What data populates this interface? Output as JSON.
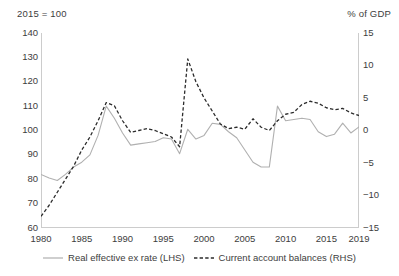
{
  "chart_data": {
    "type": "line",
    "title": "",
    "subtitle": "",
    "left_unit_label": "2015 = 100",
    "right_unit_label": "% of GDP",
    "xlabel": "",
    "ylabel": "",
    "grid": false,
    "legend_position": "bottom",
    "xlim": [
      1980,
      2019
    ],
    "x_ticks": [
      "1980",
      "1985",
      "1990",
      "1995",
      "2000",
      "2005",
      "2010",
      "2015",
      "2019"
    ],
    "x_tick_values": [
      1980,
      1985,
      1990,
      1995,
      2000,
      2005,
      2010,
      2015,
      2019
    ],
    "left_axis": {
      "label": "2015 = 100",
      "ylim": [
        60,
        140
      ],
      "ticks": [
        "60",
        "70",
        "80",
        "90",
        "100",
        "110",
        "120",
        "130",
        "140"
      ],
      "tick_values": [
        60,
        70,
        80,
        90,
        100,
        110,
        120,
        130,
        140
      ]
    },
    "right_axis": {
      "label": "% of GDP",
      "ylim": [
        -15,
        15
      ],
      "ticks": [
        "-15",
        "-10",
        "-5",
        "0",
        "5",
        "10",
        "15"
      ],
      "tick_values": [
        -15,
        -10,
        -5,
        0,
        5,
        10,
        15
      ]
    },
    "x": [
      1980,
      1981,
      1982,
      1983,
      1984,
      1985,
      1986,
      1987,
      1988,
      1989,
      1990,
      1991,
      1992,
      1993,
      1994,
      1995,
      1996,
      1997,
      1998,
      1999,
      2000,
      2001,
      2002,
      2003,
      2004,
      2005,
      2006,
      2007,
      2008,
      2009,
      2010,
      2011,
      2012,
      2013,
      2014,
      2015,
      2016,
      2017,
      2018,
      2019
    ],
    "series": [
      {
        "name": "Real effective ex rate (LHS)",
        "axis": "left",
        "style": "solid",
        "color": "#b0b0b0",
        "unit": "2015 = 100",
        "values": [
          82.0,
          80.5,
          79.5,
          82.0,
          85.0,
          87.0,
          90.0,
          98.0,
          110.0,
          105.0,
          99.0,
          94.0,
          94.5,
          95.0,
          95.5,
          97.0,
          96.5,
          90.5,
          100.5,
          96.5,
          98.0,
          103.0,
          102.5,
          99.5,
          97.0,
          92.0,
          87.0,
          85.0,
          85.0,
          110.0,
          104.0,
          104.5,
          105.0,
          104.5,
          99.5,
          97.5,
          98.5,
          103.0,
          99.0,
          101.5
        ]
      },
      {
        "name": "Current account balances (RHS)",
        "axis": "right",
        "style": "dashed",
        "color": "#2b2b2b",
        "unit": "% of GDP",
        "values": [
          -13.2,
          -11.5,
          -9.5,
          -7.5,
          -5.5,
          -3.0,
          -1.0,
          1.5,
          4.3,
          3.8,
          1.5,
          -0.3,
          0.0,
          0.3,
          0.0,
          -0.5,
          -1.0,
          -2.5,
          11.0,
          7.5,
          5.0,
          3.0,
          1.0,
          0.3,
          0.5,
          0.2,
          1.8,
          0.5,
          0.0,
          1.5,
          2.5,
          2.8,
          4.0,
          4.5,
          4.2,
          3.5,
          3.2,
          3.4,
          2.7,
          2.3
        ]
      }
    ]
  },
  "legend": {
    "entries": [
      {
        "label": "Real effective ex rate (LHS)",
        "style": "solid",
        "color": "#b0b0b0"
      },
      {
        "label": "Current account balances (RHS)",
        "style": "dashed",
        "color": "#2b2b2b"
      }
    ]
  }
}
